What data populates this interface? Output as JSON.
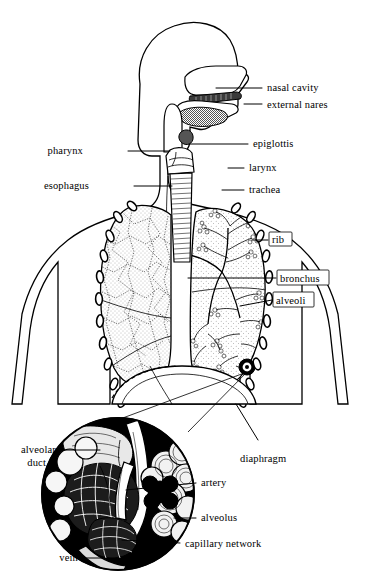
{
  "figure": {
    "colors": {
      "body_gray": "#8a8a8a",
      "ink": "#000000",
      "paper": "#ffffff",
      "inset_background": "#000000"
    }
  },
  "labels": {
    "nasal_cavity": "nasal cavity",
    "external_nares": "external nares",
    "epiglottis": "epiglottis",
    "larynx": "larynx",
    "trachea": "trachea",
    "pharynx": "pharynx",
    "esophagus": "esophagus",
    "rib": "rib",
    "bronchus": "bronchus",
    "alveoli": "alveoli",
    "diaphragm": "diaphragm",
    "alveolar_duct_line1": "alveolar",
    "alveolar_duct_line2": "duct",
    "artery": "artery",
    "alveolus": "alveolus",
    "capillary_network": "capillary network",
    "vein": "vein"
  },
  "label_list": [
    {
      "id": "nasal-cavity",
      "text": "nasal cavity",
      "side": "right",
      "boxed": false
    },
    {
      "id": "external-nares",
      "text": "external nares",
      "side": "right",
      "boxed": false
    },
    {
      "id": "epiglottis",
      "text": "epiglottis",
      "side": "right",
      "boxed": false
    },
    {
      "id": "larynx",
      "text": "larynx",
      "side": "right",
      "boxed": false
    },
    {
      "id": "trachea",
      "text": "trachea",
      "side": "right",
      "boxed": false
    },
    {
      "id": "pharynx",
      "text": "pharynx",
      "side": "left",
      "boxed": false
    },
    {
      "id": "esophagus",
      "text": "esophagus",
      "side": "left",
      "boxed": false
    },
    {
      "id": "rib",
      "text": "rib",
      "side": "right",
      "boxed": true
    },
    {
      "id": "bronchus",
      "text": "bronchus",
      "side": "right",
      "boxed": true
    },
    {
      "id": "alveoli",
      "text": "alveoli",
      "side": "right",
      "boxed": true
    },
    {
      "id": "diaphragm",
      "text": "diaphragm",
      "side": "right",
      "boxed": false
    },
    {
      "id": "alveolar-duct",
      "text": "alveolar duct",
      "side": "left",
      "boxed": false
    },
    {
      "id": "artery",
      "text": "artery",
      "side": "right",
      "boxed": false
    },
    {
      "id": "alveolus",
      "text": "alveolus",
      "side": "right",
      "boxed": false
    },
    {
      "id": "capillary-network",
      "text": "capillary network",
      "side": "right",
      "boxed": false
    },
    {
      "id": "vein",
      "text": "vein",
      "side": "left",
      "boxed": false
    }
  ]
}
